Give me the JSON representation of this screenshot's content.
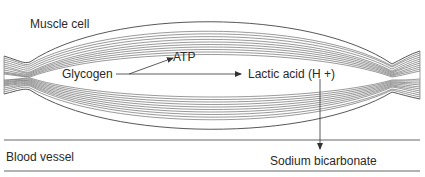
{
  "diagram": {
    "regions": {
      "muscle_cell": "Muscle cell",
      "blood_vessel": "Blood vessel"
    },
    "nodes": {
      "glycogen": "Glycogen",
      "atp": "ATP",
      "lactic_acid": "Lactic acid (H +)",
      "sodium_bicarbonate": "Sodium bicarbonate"
    },
    "edges": [
      {
        "from": "Glycogen",
        "to": "ATP"
      },
      {
        "from": "Glycogen",
        "to": "Lactic acid (H +)"
      },
      {
        "from": "Lactic acid (H +)",
        "to": "Sodium bicarbonate"
      }
    ],
    "colors": {
      "line": "#333333",
      "fiber": "#555555",
      "text": "#2a2a2a"
    }
  }
}
